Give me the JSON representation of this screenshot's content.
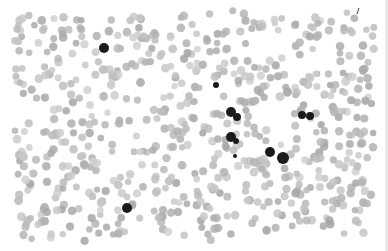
{
  "image": {
    "subject": "grayscale micrograph of a blood smear",
    "background": "#ffffff",
    "rbc_color": "#b9b9b9",
    "rbc_count_approx": 700,
    "leukocytes": [
      {
        "x": 104,
        "y": 48,
        "r": 5
      },
      {
        "x": 216,
        "y": 85,
        "r": 3
      },
      {
        "x": 231,
        "y": 112,
        "r": 5
      },
      {
        "x": 237,
        "y": 117,
        "r": 4
      },
      {
        "x": 302,
        "y": 115,
        "r": 4
      },
      {
        "x": 310,
        "y": 116,
        "r": 4
      },
      {
        "x": 231,
        "y": 137,
        "r": 5
      },
      {
        "x": 236,
        "y": 141,
        "r": 3
      },
      {
        "x": 235,
        "y": 156,
        "r": 2
      },
      {
        "x": 270,
        "y": 152,
        "r": 5
      },
      {
        "x": 283,
        "y": 158,
        "r": 6
      },
      {
        "x": 127,
        "y": 208,
        "r": 5
      }
    ],
    "leukocyte_color": "#1a1a1a"
  }
}
